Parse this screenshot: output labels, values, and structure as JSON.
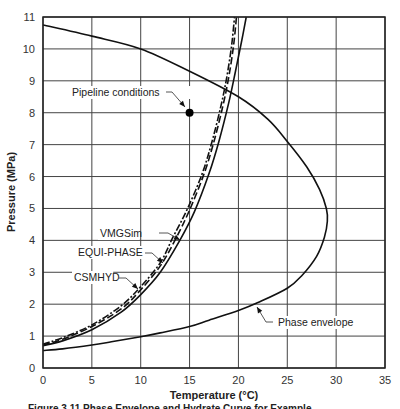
{
  "chart_data": {
    "type": "line",
    "title": "",
    "xlabel": "Temperature (°C)",
    "ylabel": "Pressure (MPa)",
    "xlim": [
      0,
      35
    ],
    "ylim": [
      0,
      11
    ],
    "xticks": [
      0,
      5,
      10,
      15,
      20,
      25,
      30,
      35
    ],
    "yticks": [
      0,
      1,
      2,
      3,
      4,
      5,
      6,
      7,
      8,
      9,
      10,
      11
    ],
    "grid": true,
    "series": [
      {
        "name": "Phase envelope",
        "style": "solid",
        "x": [
          0,
          5,
          10,
          15,
          20,
          23,
          25,
          27,
          28.3,
          29,
          29.1,
          28.8,
          28,
          26.5,
          25,
          22,
          20,
          17,
          15,
          12,
          10,
          7,
          5,
          2,
          0
        ],
        "y": [
          10.75,
          10.4,
          10.0,
          9.3,
          8.5,
          7.8,
          7.1,
          6.3,
          5.6,
          5.0,
          4.6,
          4.1,
          3.5,
          2.9,
          2.5,
          2.05,
          1.8,
          1.5,
          1.3,
          1.1,
          0.98,
          0.82,
          0.72,
          0.6,
          0.55
        ]
      },
      {
        "name": "CSMHYD",
        "style": "solid",
        "x": [
          0,
          2,
          5,
          8,
          10,
          12,
          14,
          15.5,
          17,
          18,
          19,
          19.7,
          20.3,
          20.8
        ],
        "y": [
          0.7,
          0.85,
          1.2,
          1.75,
          2.3,
          3.0,
          4.0,
          4.9,
          6.1,
          7.1,
          8.3,
          9.3,
          10.2,
          11.0
        ]
      },
      {
        "name": "EQUI-PHASE",
        "style": "dashed",
        "x": [
          0,
          2,
          5,
          8,
          10,
          12,
          13.5,
          15,
          16.5,
          17.5,
          18.4,
          19.0,
          19.5,
          19.8
        ],
        "y": [
          0.72,
          0.9,
          1.3,
          1.85,
          2.45,
          3.2,
          4.0,
          4.95,
          6.1,
          7.1,
          8.2,
          9.1,
          10.1,
          11.0
        ]
      },
      {
        "name": "VMGSim",
        "style": "dash-dot",
        "x": [
          0,
          2,
          5,
          8,
          10,
          12,
          13.3,
          14.8,
          16.3,
          17.3,
          18.2,
          18.8,
          19.3,
          19.6
        ],
        "y": [
          0.75,
          0.95,
          1.35,
          1.95,
          2.55,
          3.3,
          4.1,
          5.0,
          6.1,
          7.1,
          8.2,
          9.1,
          10.1,
          11.0
        ]
      }
    ],
    "points": [
      {
        "name": "Pipeline conditions",
        "x": 15,
        "y": 8
      }
    ],
    "annotations": [
      {
        "text": "Pipeline conditions",
        "target": [
          15,
          8
        ]
      },
      {
        "text": "VMGSim",
        "target": [
          14.3,
          4.0
        ]
      },
      {
        "text": "EQUI-PHASE",
        "target": [
          12.2,
          3.3
        ]
      },
      {
        "text": "CSMHYD",
        "target": [
          9.8,
          2.4
        ]
      },
      {
        "text": "Phase envelope",
        "target": [
          22.0,
          1.95
        ]
      }
    ],
    "legend": "none (inline annotations)"
  },
  "caption": "Figure 3.11 Phase Envelope and Hydrate Curve for Example ..."
}
